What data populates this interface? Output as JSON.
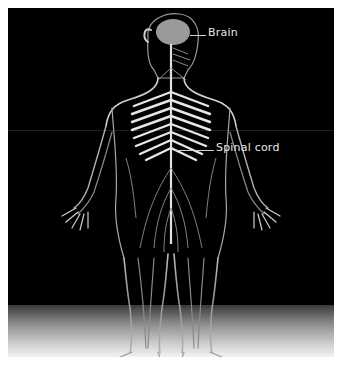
{
  "diagram": {
    "background_color": "#000000",
    "floor_gradient": [
      "#3a3a3a",
      "#f2f2f2"
    ],
    "labels": [
      {
        "id": "brain",
        "text": "Brain"
      },
      {
        "id": "spinal_cord",
        "text": "Spinal cord"
      }
    ]
  }
}
